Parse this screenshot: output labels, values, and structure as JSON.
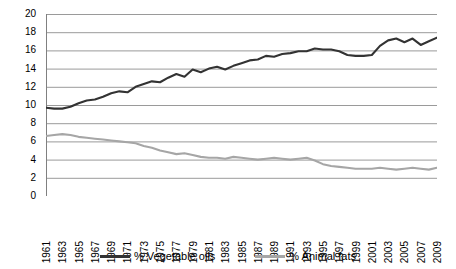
{
  "chart_data": {
    "type": "line",
    "title": "",
    "subtitle": "",
    "xlabel": "",
    "ylabel": "",
    "xlim": [
      1961,
      2009
    ],
    "ylim": [
      0,
      20
    ],
    "y_ticks": [
      0,
      2,
      4,
      6,
      8,
      10,
      12,
      14,
      16,
      18,
      20
    ],
    "grid": true,
    "grid_axis": "y",
    "legend_position": "bottom",
    "x": [
      1961,
      1962,
      1963,
      1964,
      1965,
      1966,
      1967,
      1968,
      1969,
      1970,
      1971,
      1972,
      1973,
      1974,
      1975,
      1976,
      1977,
      1978,
      1979,
      1980,
      1981,
      1982,
      1983,
      1984,
      1985,
      1986,
      1987,
      1988,
      1989,
      1990,
      1991,
      1992,
      1993,
      1994,
      1995,
      1996,
      1997,
      1998,
      1999,
      2000,
      2001,
      2002,
      2003,
      2004,
      2005,
      2006,
      2007,
      2008,
      2009
    ],
    "x_tick_labels": [
      "1961",
      "1963",
      "1965",
      "1967",
      "1969",
      "1971",
      "1973",
      "1975",
      "1977",
      "1979",
      "1981",
      "1983",
      "1985",
      "1987",
      "1989",
      "1991",
      "1993",
      "1995",
      "1997",
      "1999",
      "2001",
      "2003",
      "2005",
      "2007",
      "2009"
    ],
    "series": [
      {
        "name": "% Vegetable oils",
        "color": "#333333",
        "values": [
          9.7,
          9.6,
          9.6,
          9.8,
          10.2,
          10.5,
          10.6,
          10.9,
          11.3,
          11.5,
          11.4,
          12.0,
          12.3,
          12.6,
          12.5,
          13.0,
          13.4,
          13.1,
          13.9,
          13.6,
          14.0,
          14.2,
          13.9,
          14.3,
          14.6,
          14.9,
          15.0,
          15.4,
          15.3,
          15.6,
          15.7,
          15.9,
          15.9,
          16.2,
          16.1,
          16.1,
          15.9,
          15.5,
          15.4,
          15.4,
          15.5,
          16.5,
          17.1,
          17.3,
          16.9,
          17.3,
          16.6,
          17.0,
          17.4
        ]
      },
      {
        "name": "% Animal fats",
        "color": "#a6a6a6",
        "values": [
          6.6,
          6.7,
          6.8,
          6.7,
          6.5,
          6.4,
          6.3,
          6.2,
          6.1,
          6.0,
          5.9,
          5.8,
          5.5,
          5.3,
          5.0,
          4.8,
          4.6,
          4.7,
          4.5,
          4.3,
          4.2,
          4.2,
          4.1,
          4.3,
          4.2,
          4.1,
          4.0,
          4.1,
          4.2,
          4.1,
          4.0,
          4.1,
          4.2,
          3.9,
          3.5,
          3.3,
          3.2,
          3.1,
          3.0,
          3.0,
          3.0,
          3.1,
          3.0,
          2.9,
          3.0,
          3.1,
          3.0,
          2.9,
          3.1
        ]
      }
    ]
  },
  "legend": {
    "entries": [
      {
        "label": "% Vegetable oils",
        "color": "#333333"
      },
      {
        "label": "% Animal fats",
        "color": "#a6a6a6"
      }
    ]
  },
  "colors": {
    "vegetable_oils": "#333333",
    "animal_fats": "#a6a6a6",
    "gridline": "#9a9a9a",
    "axis": "#808080",
    "background": "#ffffff",
    "text": "#000000"
  }
}
